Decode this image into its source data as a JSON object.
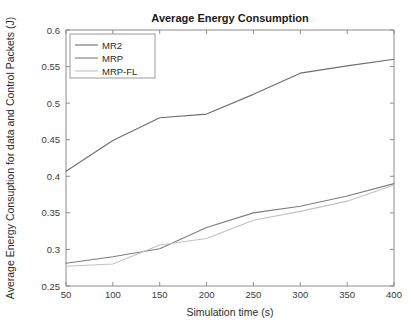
{
  "chart_data": {
    "type": "line",
    "title": "Average Energy Consumption",
    "xlabel": "Simulation time (s)",
    "ylabel": "Average Energy Consuption for data and Control Packets (J)",
    "xlim": [
      50,
      400
    ],
    "ylim": [
      0.25,
      0.6
    ],
    "xticks": [
      50,
      100,
      150,
      200,
      250,
      300,
      350,
      400
    ],
    "yticks": [
      0.25,
      0.3,
      0.35,
      0.4,
      0.45,
      0.5,
      0.55,
      0.6
    ],
    "xtick_labels": [
      "50",
      "100",
      "150",
      "200",
      "250",
      "300",
      "350",
      "400"
    ],
    "ytick_labels": [
      "0.25",
      "0.3",
      "0.35",
      "0.4",
      "0.45",
      "0.5",
      "0.55",
      "0.6"
    ],
    "grid": false,
    "legend_position": "top-left",
    "x": [
      50,
      100,
      150,
      200,
      250,
      300,
      350,
      400
    ],
    "series": [
      {
        "name": "MR2",
        "color": "#6e6e6e",
        "values": [
          0.407,
          0.449,
          0.48,
          0.485,
          0.512,
          0.541,
          0.551,
          0.56
        ]
      },
      {
        "name": "MRP",
        "color": "#7d7d7d",
        "values": [
          0.281,
          0.29,
          0.301,
          0.33,
          0.35,
          0.359,
          0.373,
          0.39
        ]
      },
      {
        "name": "MRP-FL",
        "color": "#c2c2c2",
        "values": [
          0.277,
          0.28,
          0.306,
          0.315,
          0.34,
          0.352,
          0.366,
          0.388
        ]
      }
    ]
  },
  "colors": {
    "axis": "#8c8c8c",
    "text": "#2b2b2b",
    "background": "#ffffff"
  }
}
